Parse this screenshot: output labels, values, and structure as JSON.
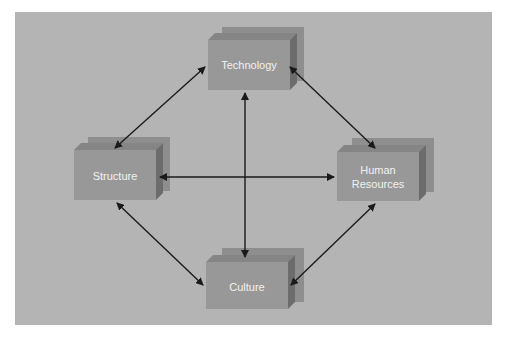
{
  "diagram": {
    "title": "",
    "colors": {
      "background": "#b4b4b4",
      "box_front": "#989898",
      "box_top": "#858585",
      "box_side": "#6c6c6c",
      "shadow": "#8e8e8e",
      "arrow": "#1a1a1a",
      "label": "#f2f2f2"
    },
    "nodes": [
      {
        "id": "technology",
        "label": "Technology"
      },
      {
        "id": "structure",
        "label": "Structure"
      },
      {
        "id": "human_resources",
        "label_line1": "Human",
        "label_line2": "Resources"
      },
      {
        "id": "culture",
        "label": "Culture"
      }
    ],
    "edges": [
      {
        "from": "technology",
        "to": "structure",
        "bidirectional": true
      },
      {
        "from": "technology",
        "to": "human_resources",
        "bidirectional": true
      },
      {
        "from": "technology",
        "to": "culture",
        "bidirectional": true
      },
      {
        "from": "structure",
        "to": "human_resources",
        "bidirectional": true
      },
      {
        "from": "structure",
        "to": "culture",
        "bidirectional": true
      },
      {
        "from": "human_resources",
        "to": "culture",
        "bidirectional": true
      }
    ]
  }
}
